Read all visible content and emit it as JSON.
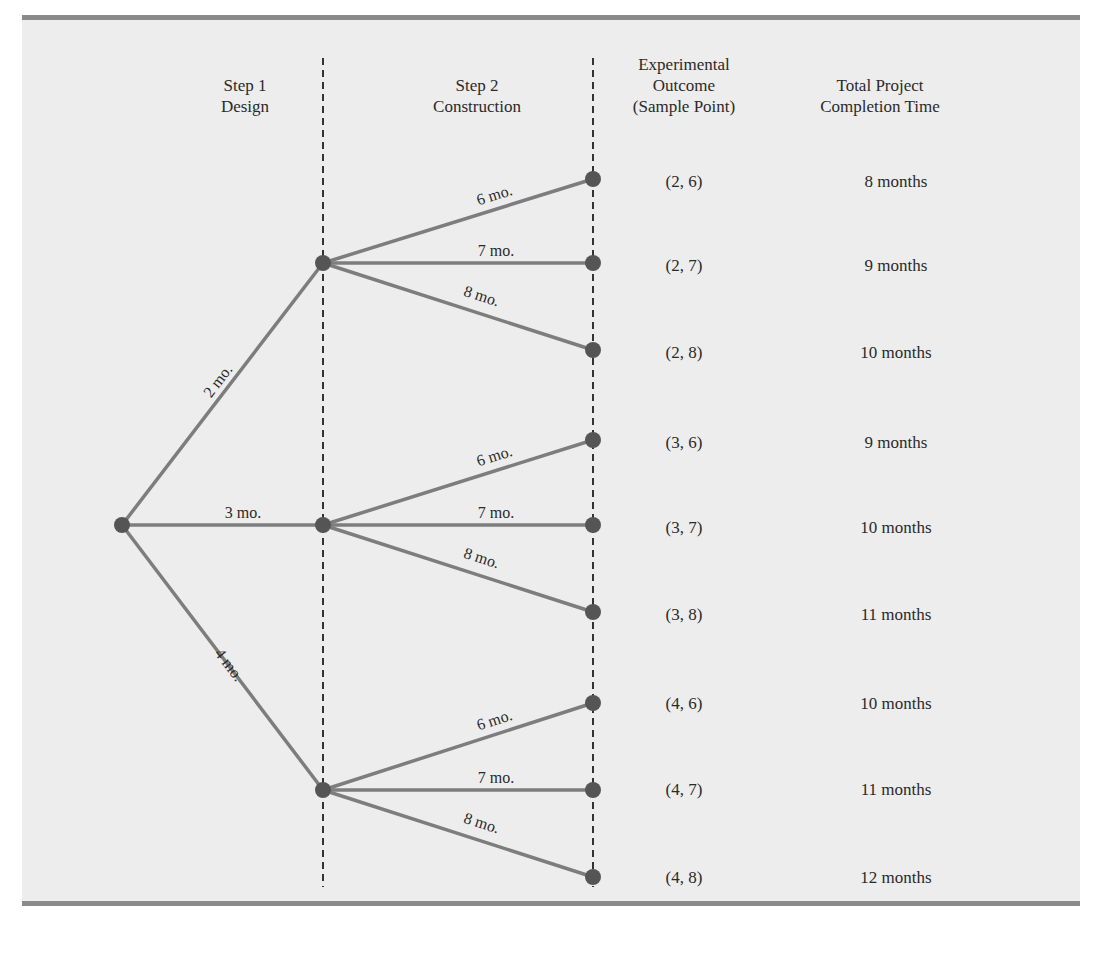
{
  "headers": {
    "step1": [
      "Step 1",
      "Design"
    ],
    "step2": [
      "Step 2",
      "Construction"
    ],
    "outcome": [
      "Experimental",
      "Outcome",
      "(Sample Point)"
    ],
    "total": [
      "Total Project",
      "Completion Time"
    ]
  },
  "colors": {
    "panel_bg": "#ededed",
    "rule": "#8a8a8a",
    "branch": "#7d7d7d",
    "node": "#555555",
    "dashed": "#333333"
  },
  "tree": {
    "step1_branches": [
      {
        "label": "2 mo."
      },
      {
        "label": "3 mo."
      },
      {
        "label": "4 mo."
      }
    ],
    "step2_branch_labels": [
      "6 mo.",
      "7 mo.",
      "8 mo."
    ]
  },
  "outcomes": [
    {
      "sample_point": "(2, 6)",
      "total": "8 months"
    },
    {
      "sample_point": "(2, 7)",
      "total": "9 months"
    },
    {
      "sample_point": "(2, 8)",
      "total": "10 months"
    },
    {
      "sample_point": "(3, 6)",
      "total": "9 months"
    },
    {
      "sample_point": "(3, 7)",
      "total": "10 months"
    },
    {
      "sample_point": "(3, 8)",
      "total": "11 months"
    },
    {
      "sample_point": "(4, 6)",
      "total": "10 months"
    },
    {
      "sample_point": "(4, 7)",
      "total": "11 months"
    },
    {
      "sample_point": "(4, 8)",
      "total": "12 months"
    }
  ]
}
